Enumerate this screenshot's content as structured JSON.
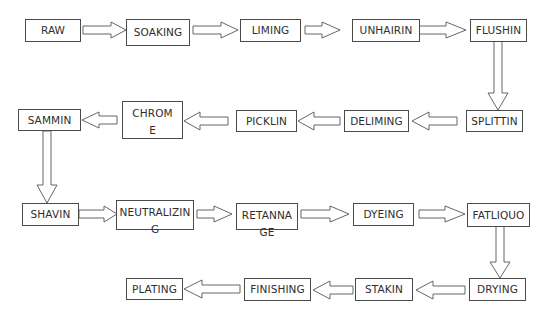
{
  "diagram": {
    "steps": [
      {
        "id": "raw",
        "label": "RAW"
      },
      {
        "id": "soaking",
        "label": "SOAKING"
      },
      {
        "id": "liming",
        "label": "LIMING"
      },
      {
        "id": "unhairin",
        "label": "UNHAIRIN"
      },
      {
        "id": "flushin",
        "label": "FLUSHIN"
      },
      {
        "id": "splittin",
        "label": "SPLITTIN"
      },
      {
        "id": "deliming",
        "label": "DELIMING"
      },
      {
        "id": "picklin",
        "label": "PICKLIN"
      },
      {
        "id": "chrome",
        "label": "CHROM\nE"
      },
      {
        "id": "sammin",
        "label": "SAMMIN"
      },
      {
        "id": "shavin",
        "label": "SHAVIN"
      },
      {
        "id": "neutralizing",
        "label": "NEUTRALIZIN\nG"
      },
      {
        "id": "retannage",
        "label": "RETANNA\nGE"
      },
      {
        "id": "dyeing",
        "label": "DYEING"
      },
      {
        "id": "fatliquo",
        "label": "FATLIQUO"
      },
      {
        "id": "drying",
        "label": "DRYING"
      },
      {
        "id": "stakin",
        "label": "STAKIN"
      },
      {
        "id": "finishing",
        "label": "FINISHING"
      },
      {
        "id": "plating",
        "label": "PLATING"
      }
    ],
    "edges": [
      [
        "raw",
        "soaking"
      ],
      [
        "soaking",
        "liming"
      ],
      [
        "liming",
        "unhairin"
      ],
      [
        "unhairin",
        "flushin"
      ],
      [
        "flushin",
        "splittin"
      ],
      [
        "splittin",
        "deliming"
      ],
      [
        "deliming",
        "picklin"
      ],
      [
        "picklin",
        "chrome"
      ],
      [
        "chrome",
        "sammin"
      ],
      [
        "sammin",
        "shavin"
      ],
      [
        "shavin",
        "neutralizing"
      ],
      [
        "neutralizing",
        "retannage"
      ],
      [
        "retannage",
        "dyeing"
      ],
      [
        "dyeing",
        "fatliquo"
      ],
      [
        "fatliquo",
        "drying"
      ],
      [
        "drying",
        "stakin"
      ],
      [
        "stakin",
        "finishing"
      ],
      [
        "finishing",
        "plating"
      ]
    ],
    "colors": {
      "border": "#4a4a4a",
      "text": "#2e2e2e",
      "background": "#ffffff"
    }
  }
}
